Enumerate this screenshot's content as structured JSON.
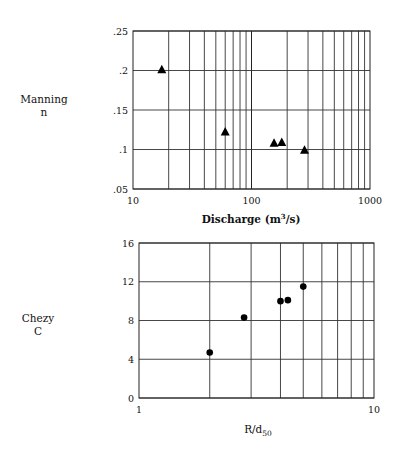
{
  "chart_data": [
    {
      "type": "scatter",
      "title": "",
      "ylabel": "Manning n",
      "ylabel_lines": [
        "Manning",
        "n"
      ],
      "xlabel": "Discharge (m³/s)",
      "xlabel_main": "Discharge  (m",
      "xlabel_sup": "3",
      "xlabel_tail": "/s)",
      "xscale": "log",
      "xlim": [
        10,
        1000
      ],
      "ylim": [
        0.05,
        0.25
      ],
      "xticks": [
        "10",
        "100",
        "1000"
      ],
      "yticks": [
        ".05",
        ".1",
        ".15",
        ".2",
        ".25"
      ],
      "ytick_values": [
        0.05,
        0.1,
        0.15,
        0.2,
        0.25
      ],
      "marker": "triangle",
      "grid": true,
      "series": [
        {
          "name": "Manning n",
          "x": [
            17.5,
            60,
            155,
            180,
            280
          ],
          "y": [
            0.201,
            0.122,
            0.108,
            0.109,
            0.099
          ]
        }
      ]
    },
    {
      "type": "scatter",
      "title": "",
      "ylabel": "Chezy C",
      "ylabel_lines": [
        "Chezy",
        "C"
      ],
      "xlabel": "R/d50",
      "xlabel_main": "R/d",
      "xlabel_sub": "50",
      "xscale": "log",
      "xlim": [
        1,
        10
      ],
      "ylim": [
        0,
        16
      ],
      "xticks": [
        "1",
        "10"
      ],
      "yticks": [
        "0",
        "4",
        "8",
        "12",
        "16"
      ],
      "ytick_values": [
        0,
        4,
        8,
        12,
        16
      ],
      "marker": "circle",
      "grid": true,
      "series": [
        {
          "name": "Chezy C",
          "x": [
            2.0,
            2.8,
            4.0,
            4.3,
            5.0
          ],
          "y": [
            4.7,
            8.3,
            10.0,
            10.1,
            11.5
          ]
        }
      ]
    }
  ]
}
